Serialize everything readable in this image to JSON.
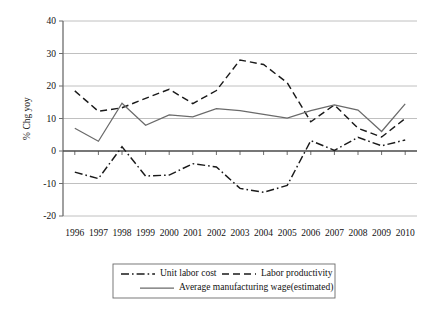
{
  "chart_data": {
    "type": "line",
    "title": "",
    "subtitle": "",
    "xlabel": "",
    "ylabel": "% Chg yoy",
    "categories": [
      "1996",
      "1997",
      "1998",
      "1999",
      "2000",
      "2001",
      "2002",
      "2003",
      "2004",
      "2005",
      "2006",
      "2007",
      "2008",
      "2009",
      "2010"
    ],
    "x": [
      1996,
      1997,
      1998,
      1999,
      2000,
      2001,
      2002,
      2003,
      2004,
      2005,
      2006,
      2007,
      2008,
      2009,
      2010
    ],
    "ylim": [
      -20,
      40
    ],
    "yticks": [
      40,
      30,
      20,
      10,
      0,
      -10,
      -20
    ],
    "ytick_labels": [
      "40",
      "30",
      "20",
      "10",
      "0",
      "-10",
      "-20"
    ],
    "grid": true,
    "legend_position": "bottom",
    "series": [
      {
        "name": "Unit labor cost",
        "style": "dash-dot",
        "color": "#1a1a1a",
        "values": [
          -6.5,
          -8.5,
          1.3,
          -7.7,
          -7.4,
          -3.9,
          -4.9,
          -11.5,
          -12.7,
          -10.6,
          3.2,
          0.2,
          4.2,
          1.6,
          3.4
        ]
      },
      {
        "name": "Labor productivity",
        "style": "dashed",
        "color": "#1a1a1a",
        "values": [
          18.5,
          12.2,
          13.3,
          16.2,
          19.0,
          14.6,
          18.6,
          28.0,
          26.6,
          21.0,
          9.0,
          14.2,
          7.0,
          4.3,
          10.0
        ]
      },
      {
        "name": "Average manufacturing wage(estimated)",
        "style": "solid",
        "color": "#6a6a6a",
        "values": [
          7.0,
          3.0,
          14.7,
          7.9,
          11.1,
          10.5,
          13.0,
          12.4,
          11.3,
          10.1,
          12.4,
          14.2,
          12.6,
          6.0,
          14.5
        ]
      }
    ]
  },
  "legend": {
    "entries": [
      {
        "label": "Unit labor cost",
        "style": "dash-dot"
      },
      {
        "label": "Labor productivity",
        "style": "dashed"
      },
      {
        "label": "Average manufacturing wage(estimated)",
        "style": "solid"
      }
    ]
  }
}
